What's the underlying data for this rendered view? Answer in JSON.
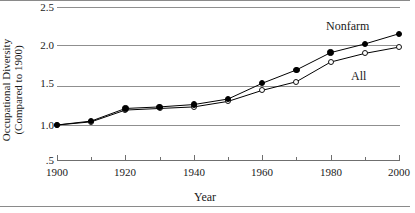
{
  "chart_data": {
    "type": "line",
    "title": "",
    "xlabel": "Year",
    "ylabel_line1": "Occupational Diversity",
    "ylabel_line2": "(Compared to 1900)",
    "x": [
      1900,
      1910,
      1920,
      1930,
      1940,
      1950,
      1960,
      1970,
      1980,
      1990,
      2000
    ],
    "xlim": [
      1900,
      2000
    ],
    "ylim": [
      0.5,
      2.5
    ],
    "grid": true,
    "legend_position": "inline-annotation",
    "xtick_labels": [
      "1900",
      "1920",
      "1940",
      "1960",
      "1980",
      "2000"
    ],
    "xticks_major": [
      1900,
      1920,
      1940,
      1960,
      1980,
      2000
    ],
    "xticks_minor": [
      1910,
      1930,
      1950,
      1970,
      1990
    ],
    "ytick_labels": [
      "2.5",
      "2.0",
      "1.5",
      "1.0",
      ".5"
    ],
    "yticks": [
      2.5,
      2.0,
      1.5,
      1.0,
      0.5
    ],
    "gridlines": [
      2.5,
      2.0,
      1.5,
      1.0
    ],
    "series": [
      {
        "name": "Nonfarm",
        "marker": "filled-circle",
        "color": "#000000",
        "label_text": "Nonfarm",
        "x": [
          1900,
          1910,
          1920,
          1930,
          1940,
          1950,
          1960,
          1970,
          1980,
          1990,
          2000
        ],
        "values": [
          1.0,
          1.05,
          1.21,
          1.23,
          1.26,
          1.33,
          1.53,
          1.7,
          1.92,
          2.03,
          2.16
        ]
      },
      {
        "name": "All",
        "marker": "open-circle",
        "color": "#000000",
        "label_text": "All",
        "x": [
          1900,
          1910,
          1920,
          1930,
          1940,
          1950,
          1960,
          1970,
          1980,
          1990,
          2000
        ],
        "values": [
          1.0,
          1.04,
          1.19,
          1.21,
          1.23,
          1.3,
          1.44,
          1.55,
          1.8,
          1.91,
          1.99
        ]
      }
    ]
  },
  "annotations": {
    "nonfarm_label": "Nonfarm",
    "all_label": "All"
  }
}
